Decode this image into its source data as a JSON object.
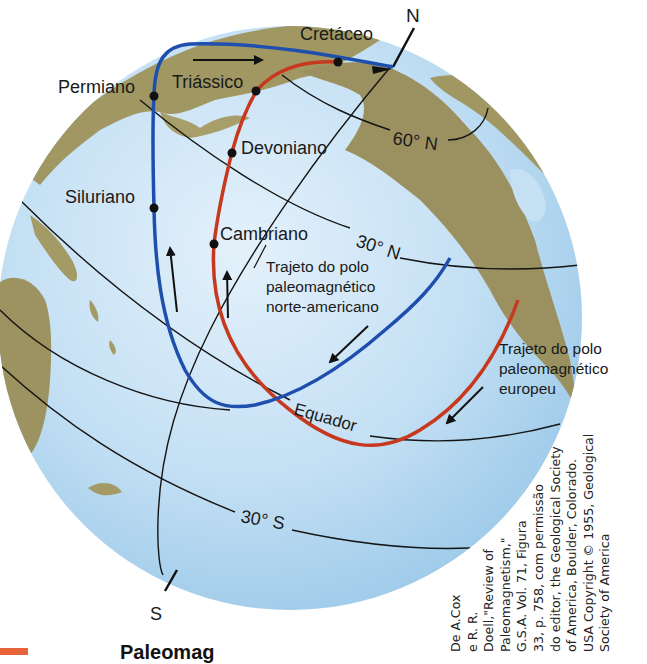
{
  "figure": {
    "colors": {
      "ocean": "#bcdcf2",
      "land": "#9e9460",
      "north_american_path": "#1e4fae",
      "european_path": "#c7391f",
      "grid_lines": "#151515",
      "caption_accent": "#e8623a"
    },
    "poles": {
      "north": "N",
      "south": "S"
    },
    "latitude_labels": {
      "lat_60n": "60° N",
      "lat_30n": "30° N",
      "equator": "Equador",
      "lat_30s": "30° S"
    },
    "period_labels": {
      "cretaceous": "Cretáceo",
      "permian": "Permiano",
      "triassic": "Triássico",
      "devonian": "Devoniano",
      "silurian": "Siluriano",
      "cambrian": "Cambriano"
    },
    "paths": {
      "north_american": {
        "label_lines": [
          "Trajeto do polo",
          "paleomagnético",
          "norte-americano"
        ]
      },
      "european": {
        "label_lines": [
          "Trajeto do polo",
          "paleomagnético",
          "europeu"
        ]
      }
    },
    "credit_lines": [
      "De A.Cox",
      "e R. R.",
      "Doell,\"Review of",
      "Paleomagnetism,\"",
      "G.S.A. Vol. 71, Figura",
      "33, p. 758, com permissão",
      "do editor, the Geological Society",
      "of America, Boulder, Colorado.",
      "USA Copyright © 1955, Geological",
      "Society of America"
    ],
    "caption_fragment": "Paleomag"
  }
}
